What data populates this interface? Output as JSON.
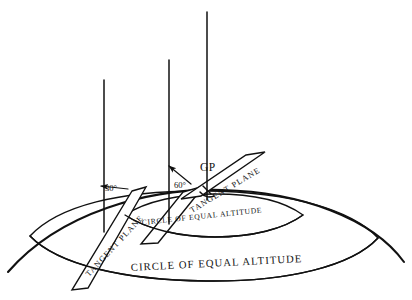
{
  "figure": {
    "background_color": "#ffffff",
    "ink_color": "#111111",
    "width": 412,
    "height": 300
  },
  "labels": {
    "gp": "GP",
    "angle_left": "30°",
    "angle_right": "60°",
    "tangent_plane_left": "TANGENT PLANE",
    "tangent_plane_right": "TANGENT PLANE",
    "circle_inner": "CIRCLE OF EQUAL ALTITUDE",
    "circle_outer": "CIRCLE OF EQUAL ALTITUDE"
  },
  "geometry": {
    "earth_arc": "M 8,272 C 60,212 150,188 222,190 C 300,192 372,218 404,262",
    "ellipse_outer": "M 30,236 C 58,206 120,190 206,191 C 292,192 352,210 378,238 C 352,266 288,282 206,281 C 124,280 58,265 30,236 Z",
    "ellipse_inner": "M 125,215 C 146,201 180,194 215,194 C 252,194 284,201 303,215 C 284,229 252,237 215,237 C 180,237 146,229 125,215 Z",
    "vertical_lines": [
      {
        "name": "left",
        "x": 104,
        "y_top": 80,
        "y_bottom": 232
      },
      {
        "name": "middle",
        "x": 169,
        "y_top": 60,
        "y_bottom": 224
      },
      {
        "name": "right",
        "x": 207,
        "y_top": 12,
        "y_bottom": 200
      }
    ],
    "planes": [
      {
        "name": "left-tangent-plane",
        "points": "132,191 146,187 88,288 72,290"
      },
      {
        "name": "middle-tangent-plane",
        "points": "183,192 204,186 158,243 141,244"
      },
      {
        "name": "right-tangent-plane",
        "points": "246,155 265,152 201,196 181,199"
      }
    ]
  },
  "annotations": {
    "arrow_left": {
      "from": "126,189",
      "to": "100,186"
    },
    "arrow_right": {
      "from": "189,182",
      "to": "168,166"
    },
    "gp_marker": {
      "x": 207,
      "y": 190
    }
  }
}
